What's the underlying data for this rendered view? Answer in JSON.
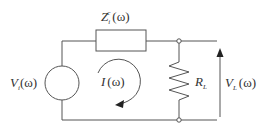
{
  "diagram": {
    "type": "circuit",
    "labels": {
      "source_impedance": {
        "base": "Z",
        "sub": "i",
        "sup": "c",
        "arg": "(ω)"
      },
      "source_voltage": {
        "base": "V",
        "sub": "i",
        "arg": "(ω)"
      },
      "current": {
        "base": "I",
        "arg": "(ω)"
      },
      "load_resistor": {
        "base": "R",
        "sub": "L"
      },
      "load_voltage": {
        "base": "V",
        "sub": "L",
        "arg": "(ω)"
      }
    },
    "components": [
      {
        "id": "source",
        "kind": "voltage-source"
      },
      {
        "id": "impedance",
        "kind": "impedance-box"
      },
      {
        "id": "load",
        "kind": "resistor"
      },
      {
        "id": "node-top",
        "kind": "terminal"
      },
      {
        "id": "node-bottom",
        "kind": "terminal"
      }
    ],
    "colors": {
      "wire": "#555555",
      "text": "#333333"
    }
  }
}
